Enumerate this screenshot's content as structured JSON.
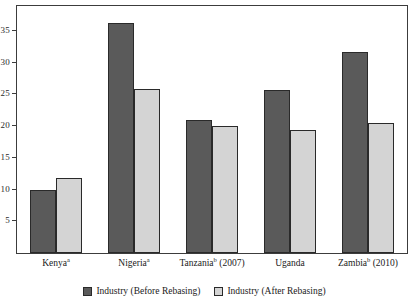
{
  "chart_data": {
    "type": "bar",
    "title": "",
    "subtitle": "",
    "xlabel": "",
    "ylabel": "",
    "categories": [
      "Kenyaᵃ",
      "Nigeriaᵃ",
      "Tanzaniaᵇ (2007)",
      "Uganda",
      "Zambiaᵇ (2010)"
    ],
    "category_parts": [
      {
        "name": "Kenya",
        "note": "a",
        "year": ""
      },
      {
        "name": "Nigeria",
        "note": "a",
        "year": ""
      },
      {
        "name": "Tanzania",
        "note": "b",
        "year": " (2007)"
      },
      {
        "name": "Uganda",
        "note": "",
        "year": ""
      },
      {
        "name": "Zambia",
        "note": "b",
        "year": " (2010)"
      }
    ],
    "series": [
      {
        "name": "Industry (Before Rebasing)",
        "color": "#5a5a5a",
        "values": [
          10.0,
          36.2,
          20.9,
          25.7,
          31.6
        ]
      },
      {
        "name": "Industry (After Rebasing)",
        "color": "#d4d4d4",
        "values": [
          11.8,
          25.8,
          20.0,
          19.4,
          20.5
        ]
      }
    ],
    "yticks": [
      5,
      10,
      15,
      20,
      25,
      30,
      35
    ],
    "ytick_labels": [
      "5",
      "10",
      "15",
      "20",
      "25",
      "30",
      "35"
    ],
    "ylim": [
      0,
      38.9
    ],
    "xlim_note": "categorical",
    "grid": false,
    "legend_position": "bottom-center",
    "frame": true
  },
  "legend": {
    "items": [
      {
        "label": "Industry (Before Rebasing)",
        "swatch": "before"
      },
      {
        "label": "Industry (After Rebasing)",
        "swatch": "after"
      }
    ]
  },
  "colors": {
    "before_rebasing": "#5a5a5a",
    "after_rebasing": "#d4d4d4",
    "axis": "#3c3c3c",
    "text": "#1a1a1a",
    "background": "#ffffff"
  }
}
